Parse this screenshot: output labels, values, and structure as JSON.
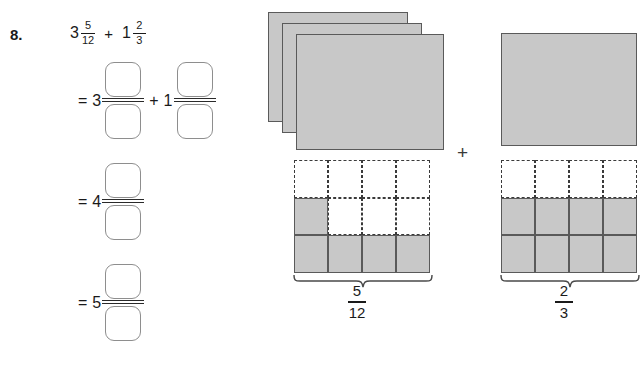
{
  "problem": {
    "number": "8.",
    "expression": {
      "term1_whole": "3",
      "term1_numerator": "5",
      "term1_denominator": "12",
      "operator": "+",
      "term2_whole": "1",
      "term2_numerator": "2",
      "term2_denominator": "3"
    }
  },
  "work_rows": [
    {
      "equals": "=",
      "left_whole": "3",
      "left_numerator": "",
      "left_denominator": "",
      "operator": "+",
      "right_whole": "1",
      "right_numerator": "",
      "right_denominator": ""
    },
    {
      "equals": "=",
      "left_whole": "4",
      "left_numerator": "",
      "left_denominator": ""
    },
    {
      "equals": "=",
      "left_whole": "5",
      "left_numerator": "",
      "left_denominator": ""
    }
  ],
  "diagram": {
    "plus_operator": "+",
    "left_model": {
      "whole_count": 3,
      "fraction_label_numerator": "5",
      "fraction_label_denominator": "12",
      "grid_columns": 4,
      "grid_rows": 3,
      "shaded_cells": [
        [
          1,
          0
        ],
        [
          2,
          0
        ],
        [
          2,
          1
        ],
        [
          2,
          2
        ],
        [
          2,
          3
        ]
      ]
    },
    "right_model": {
      "whole_count": 1,
      "fraction_label_numerator": "2",
      "fraction_label_denominator": "3",
      "grid_columns": 4,
      "grid_rows": 3,
      "shaded_cells": [
        [
          1,
          0
        ],
        [
          1,
          1
        ],
        [
          1,
          2
        ],
        [
          1,
          3
        ],
        [
          2,
          0
        ],
        [
          2,
          1
        ],
        [
          2,
          2
        ],
        [
          2,
          3
        ]
      ]
    }
  },
  "colors": {
    "shaded_fill": "#c8c8c8",
    "shape_outline": "#5a5a5a",
    "dashed_outline": "#3a3a3a",
    "box_outline": "#8e8e8e",
    "text": "#1a1a1a",
    "page_background": "#ffffff"
  }
}
